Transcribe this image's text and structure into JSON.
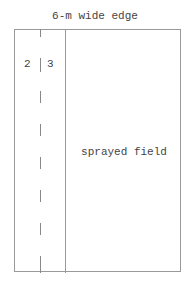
{
  "diagram": {
    "title": "6-m wide edge",
    "edge_labels": {
      "left": "2",
      "right": "3"
    },
    "field_label": "sprayed field",
    "line_color": "#999999"
  }
}
